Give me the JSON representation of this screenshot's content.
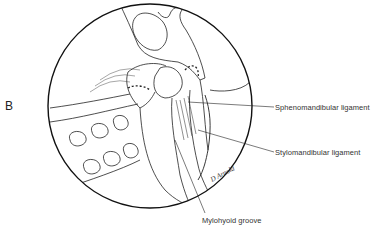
{
  "figure": {
    "panel_letter": "B",
    "labels": {
      "sphenomandibular": "Sphenomandibular ligament",
      "stylomandibular": "Stylomandibular ligament",
      "mylohyoid": "Mylohyoid groove"
    },
    "signature": "D Arnold",
    "colors": {
      "ink": "#1a1a1a",
      "background": "#ffffff"
    }
  }
}
